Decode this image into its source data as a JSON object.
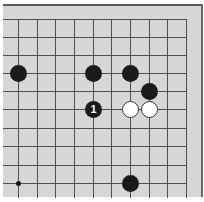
{
  "board": {
    "background": "#d6d6d6",
    "line_color": "#505050",
    "grid": {
      "columns": 10,
      "rows": 10,
      "x_positions": [
        18,
        37,
        55,
        74,
        93,
        111,
        130,
        149,
        167,
        186
      ],
      "y_positions": [
        19,
        37,
        55,
        73,
        91,
        109,
        128,
        146,
        165,
        183
      ],
      "edges": {
        "top": true,
        "right": true,
        "left": false,
        "bottom": false
      }
    },
    "star_points": [
      {
        "col": 0,
        "row": 9
      }
    ],
    "stones": [
      {
        "color": "black",
        "col": 0,
        "row": 3,
        "label": ""
      },
      {
        "color": "black",
        "col": 4,
        "row": 3,
        "label": ""
      },
      {
        "color": "black",
        "col": 6,
        "row": 3,
        "label": ""
      },
      {
        "color": "black",
        "col": 7,
        "row": 4,
        "label": ""
      },
      {
        "color": "black",
        "col": 4,
        "row": 5,
        "label": "1"
      },
      {
        "color": "white",
        "col": 6,
        "row": 5,
        "label": ""
      },
      {
        "color": "white",
        "col": 7,
        "row": 5,
        "label": ""
      },
      {
        "color": "black",
        "col": 6,
        "row": 9,
        "label": ""
      }
    ]
  }
}
